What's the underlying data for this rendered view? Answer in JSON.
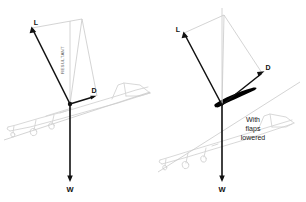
{
  "figure": {
    "background_color": "#ffffff",
    "vector_color": "#111111",
    "construction_line_color": "#c9c9c9",
    "aircraft_outline_color": "#d2d2d2",
    "flap_color": "#000000",
    "panels": [
      {
        "id": "clean",
        "caption": "",
        "labels": {
          "lift": "L",
          "drag": "D",
          "weight": "W",
          "resultant": "RESULTANT"
        }
      },
      {
        "id": "flaps-lowered",
        "caption_lines": [
          "With",
          "flaps",
          "lowered"
        ],
        "labels": {
          "lift": "L",
          "drag": "D",
          "weight": "W",
          "resultant": ""
        }
      }
    ]
  },
  "left_panel": {
    "lift_label": "L",
    "drag_label": "D",
    "weight_label": "W",
    "resultant_label": "RESULTANT"
  },
  "right_panel": {
    "lift_label": "L",
    "drag_label": "D",
    "weight_label": "W",
    "caption_line_1": "With",
    "caption_line_2": "flaps",
    "caption_line_3": "lowered"
  }
}
